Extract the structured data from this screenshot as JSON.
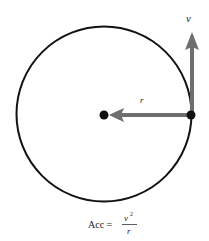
{
  "diagram": {
    "labels": {
      "velocity": "v",
      "radius": "r"
    },
    "formula": {
      "lhs": "Acc =",
      "numerator": "v",
      "numerator_exp": "2",
      "denominator": "r"
    },
    "colors": {
      "circle": "#111111",
      "arrow": "#6e6e6e",
      "dot": "#111111"
    }
  }
}
